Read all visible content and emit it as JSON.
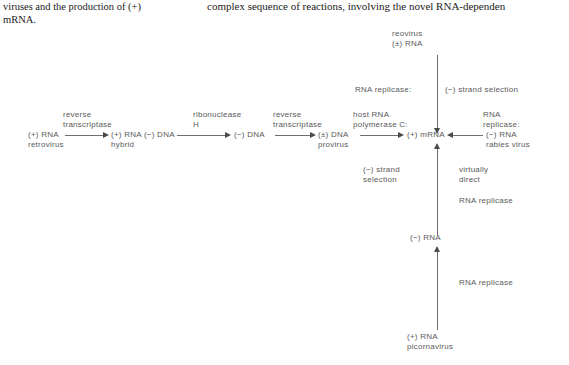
{
  "captions": {
    "left": [
      "viruses and the production of (+)",
      "mRNA."
    ],
    "right": [
      "complex sequence of reactions, involving the novel RNA-dependen"
    ]
  },
  "diagram": {
    "title_semantics": "virus-replication-strategies-flow-diagram",
    "nodes": {
      "retrovirus_rna": [
        "(+) RNA",
        "retrovirus"
      ],
      "hybrid": [
        "(+) RNA (−) DNA",
        "hybrid"
      ],
      "minus_dna": [
        "(−) DNA"
      ],
      "provirus": [
        "(±) DNA",
        "provirus"
      ],
      "mrna": [
        "(+) mRNA"
      ],
      "reovirus": [
        "reovirus",
        "(±) RNA"
      ],
      "rabies": [
        "(−) RNA",
        "rabies virus"
      ],
      "minus_rna": [
        "(−) RNA"
      ],
      "picornavirus": [
        "(+) RNA",
        "picornavirus"
      ]
    },
    "labels": {
      "reverse_transcriptase_1": [
        "reverse",
        "transcriptase"
      ],
      "ribonuclease_h": [
        "ribonuclease",
        "H"
      ],
      "reverse_transcriptase_2": [
        "reverse",
        "transcriptase"
      ],
      "host_rna_polymerase": [
        "host RNA",
        "polymerase C:"
      ],
      "rna_replicase_top": [
        "RNA replicase:"
      ],
      "minus_strand_selection_top": [
        "(−) strand selection"
      ],
      "rna_replicase_right": [
        "RNA",
        "replicase:"
      ],
      "minus_strand_selection_mid": [
        "(−) strand",
        "selection"
      ],
      "virtually_direct": [
        "virtually",
        "direct"
      ],
      "rna_replicase_upper": [
        "RNA replicase"
      ],
      "rna_replicase_lower": [
        "RNA replicase"
      ]
    },
    "colors": {
      "line": "#6e6e6e",
      "arrowhead": "#4a4a4a",
      "diagram_text": "#5a5a5a",
      "caption_text": "#1a1a1a",
      "background": "#ffffff"
    }
  }
}
